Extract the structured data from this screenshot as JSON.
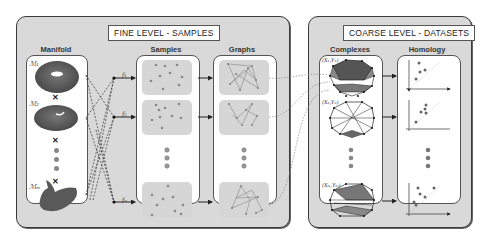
{
  "fine_panel": {
    "title": "FINE LEVEL - SAMPLES",
    "columns": {
      "manifold": "Manifold",
      "samples": "Samples",
      "graphs": "Graphs"
    },
    "manifolds": [
      {
        "label": "ℳ₁",
        "shape": "torus"
      },
      {
        "label": "ℳ₂",
        "shape": "blob"
      },
      {
        "label": "ℳₘ",
        "shape": "boomerang"
      }
    ],
    "samplers": [
      "f₁",
      "f₂",
      "fₙ"
    ],
    "samples": [
      "S₁",
      "S₂",
      "Sₙ"
    ]
  },
  "coarse_panel": {
    "title": "COARSE LEVEL - DATASETS",
    "columns": {
      "complexes": "Complexes",
      "homology": "Homology"
    },
    "complexes": [
      "(X₁,Y₁)",
      "(X₂,Y₂)",
      "(Xₘ,Yₘ)"
    ]
  },
  "colors": {
    "panel_bg": "#d9d9d9",
    "tile_bg": "#d6d6d6",
    "manifold_fill": "#595959",
    "point": "#888888",
    "line": "#555555"
  }
}
